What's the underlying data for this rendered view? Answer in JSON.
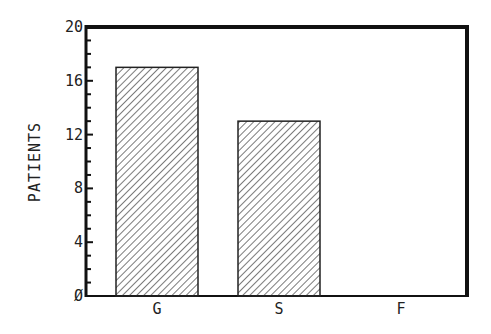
{
  "chart_data": {
    "type": "bar",
    "title": "",
    "xlabel": "",
    "ylabel": "PATIENTS",
    "categories": [
      "G",
      "S",
      "F"
    ],
    "values": [
      17,
      13,
      0
    ],
    "ylim": [
      0,
      20
    ],
    "yticks": [
      0,
      4,
      8,
      12,
      16,
      20
    ],
    "ytick_labels": [
      "Ø",
      "4",
      "8",
      "12",
      "16",
      "20"
    ],
    "minor_tick_step": 1,
    "grid": false,
    "legend": null,
    "bar_fill": "diagonal-hatch",
    "colors": {
      "frame": "#111111",
      "bar_edge": "#222222",
      "hatch": "#333333",
      "background": "#ffffff"
    }
  }
}
